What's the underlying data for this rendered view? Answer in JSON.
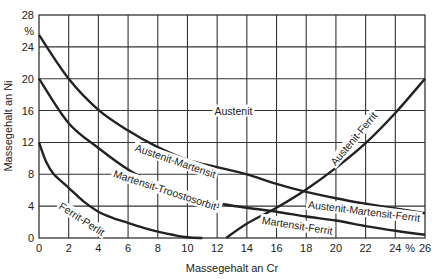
{
  "chart_data": {
    "type": "line",
    "title": "",
    "xlabel": "Massegehalt an Cr",
    "ylabel": "Massegehalt an Ni",
    "xlim": [
      0,
      26
    ],
    "ylim": [
      0,
      28
    ],
    "x_ticks": [
      "0",
      "2",
      "4",
      "6",
      "8",
      "10",
      "12",
      "14",
      "16",
      "18",
      "20",
      "22",
      "24",
      "%",
      "26"
    ],
    "x_tick_values": [
      0,
      2,
      4,
      6,
      8,
      10,
      12,
      14,
      16,
      18,
      20,
      22,
      24,
      25,
      26
    ],
    "y_ticks": [
      "0",
      "4",
      "8",
      "12",
      "16",
      "20",
      "24",
      "28"
    ],
    "y_tick_values": [
      0,
      4,
      8,
      12,
      16,
      20,
      24,
      28
    ],
    "y_unit_label": "%",
    "grid": true,
    "series": [
      {
        "name": "Austenit / Austenit-Martensit boundary",
        "x": [
          0,
          2,
          4,
          6,
          8,
          10,
          12,
          14,
          16,
          18,
          20,
          22,
          24,
          26
        ],
        "y": [
          25.5,
          20.0,
          16.1,
          13.5,
          11.4,
          9.8,
          8.9,
          8.0,
          6.8,
          5.8,
          5.0,
          4.3,
          3.7,
          3.1
        ]
      },
      {
        "name": "Martensit boundary",
        "x": [
          0,
          2,
          4,
          6,
          8,
          10,
          12,
          14,
          16,
          18,
          20,
          22,
          24,
          26
        ],
        "y": [
          20.0,
          14.4,
          11.3,
          8.6,
          6.6,
          5.4,
          4.4,
          3.8,
          3.3,
          2.7,
          2.2,
          1.5,
          0.9,
          0.4
        ]
      },
      {
        "name": "Ferrit-Perlit boundary",
        "x": [
          0,
          0.5,
          1,
          2,
          3,
          4,
          5,
          6,
          7,
          8,
          9,
          10,
          11
        ],
        "y": [
          12.0,
          9.5,
          8.0,
          6.3,
          4.6,
          3.3,
          2.5,
          1.9,
          1.3,
          0.8,
          0.4,
          0.1,
          0.0
        ]
      },
      {
        "name": "Austenit-Ferrit boundary",
        "x": [
          12.6,
          14,
          16,
          18,
          20,
          22,
          24,
          26
        ],
        "y": [
          0.0,
          1.8,
          3.8,
          6.1,
          8.8,
          11.9,
          15.7,
          20.0
        ]
      }
    ],
    "annotations": [
      {
        "text": "Austenit",
        "x": 13.1,
        "y": 16.0,
        "angle": 0
      },
      {
        "text": "Austenit-Martensit",
        "x": 9.2,
        "y": 9.7,
        "angle": 19
      },
      {
        "text": "Martensit-Troostosorbit¹",
        "x": 8.6,
        "y": 6.0,
        "angle": 18
      },
      {
        "text": "Ferrit-Perlit",
        "x": 2.9,
        "y": 2.4,
        "angle": 33
      },
      {
        "text": "Austenit-Martensit-Ferrit",
        "x": 21.9,
        "y": 3.4,
        "angle": 7
      },
      {
        "text": "Martensit-Ferrit",
        "x": 17.4,
        "y": 1.6,
        "angle": 9
      },
      {
        "text": "Austenit-Ferrit",
        "x": 21.2,
        "y": 12.5,
        "angle": -50
      }
    ]
  }
}
